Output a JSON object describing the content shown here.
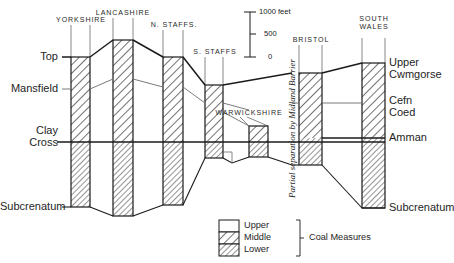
{
  "figure": {
    "type": "geological-correlation-diagram"
  },
  "scale": {
    "unit_label": "1000 feet",
    "ticks": [
      "1000 feet",
      "500",
      "0"
    ],
    "values": [
      1000,
      500,
      0
    ]
  },
  "columns": [
    {
      "id": "yorkshire",
      "header": "YORKSHIRE"
    },
    {
      "id": "lancashire",
      "header": "LANCASHIRE"
    },
    {
      "id": "n-staffs",
      "header": "N. STAFFS."
    },
    {
      "id": "s-staffs",
      "header": "S. STAFFS"
    },
    {
      "id": "warwickshire",
      "header": "WARWICKSHIRE"
    },
    {
      "id": "bristol",
      "header": "BRISTOL"
    },
    {
      "id": "south-wales",
      "header": "SOUTH\nWALES"
    }
  ],
  "left_horizons": [
    {
      "id": "top",
      "label": "Top"
    },
    {
      "id": "mansfield",
      "label": "Mansfield"
    },
    {
      "id": "clay-cross",
      "label": "Clay\nCross"
    },
    {
      "id": "subcrenatum",
      "label": "Subcrenatum"
    }
  ],
  "right_horizons": [
    {
      "id": "upper-cwmgorse",
      "label": "Upper\nCwmgorse"
    },
    {
      "id": "cefn-coed",
      "label": "Cefn\nCoed"
    },
    {
      "id": "amman",
      "label": "Amman"
    },
    {
      "id": "subcrenatum",
      "label": "Subcrenatum"
    }
  ],
  "annotation": {
    "midland_barrier": "Partial separation by Midland Barrier"
  },
  "legend": {
    "title": "Coal Measures",
    "items": [
      {
        "label": "Upper",
        "pattern": "blank"
      },
      {
        "label": "Middle",
        "pattern": "hatch-coarse"
      },
      {
        "label": "Lower",
        "pattern": "hatch-fine"
      }
    ]
  },
  "colors": {
    "ink": "#1a1a1a",
    "hatch": "#555555",
    "thin": "#6b6b6b",
    "background": "#ffffff"
  }
}
